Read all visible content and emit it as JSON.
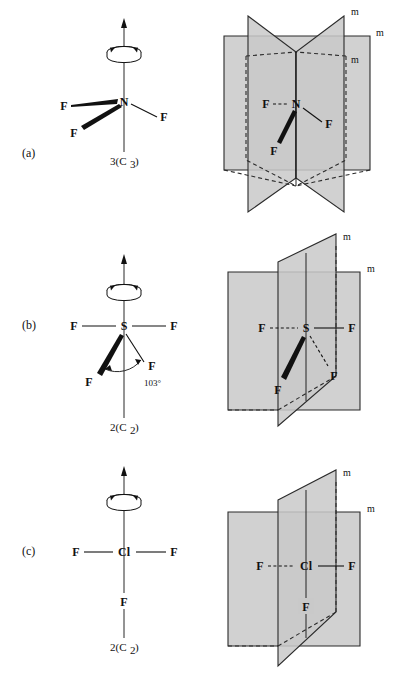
{
  "figure": {
    "title": "",
    "background_color": "#ffffff",
    "plane_fill_color": "#c9c9c9",
    "line_color": "#111111"
  },
  "panels": [
    {
      "id": "a",
      "label": "(a)",
      "molecule": {
        "central_atom": "N",
        "ligands": [
          "F",
          "F",
          "F"
        ],
        "ligand_left_upper": "F",
        "ligand_left_lower": "F",
        "ligand_right": "F"
      },
      "axis_label": "3(C₃)",
      "axis_label_text": "3(C",
      "axis_label_sub": "3",
      "axis_label_close": ")",
      "axis_count": "3",
      "mirror_labels": [
        "m",
        "m",
        "m"
      ],
      "mirror_plane_count": 3,
      "rotation_icon": "rotation-axis-icon"
    },
    {
      "id": "b",
      "label": "(b)",
      "molecule": {
        "central_atom": "S",
        "ligands": [
          "F",
          "F",
          "F",
          "F"
        ],
        "ligand_left": "F",
        "ligand_right": "F",
        "ligand_wedge": "F",
        "ligand_dashed": "F"
      },
      "angle_label": "103°",
      "axis_label": "2(C₂)",
      "axis_label_text": "2(C",
      "axis_label_sub": "2",
      "axis_label_close": ")",
      "axis_count": "2",
      "mirror_labels": [
        "m",
        "m"
      ],
      "mirror_plane_count": 2,
      "rotation_icon": "rotation-axis-icon"
    },
    {
      "id": "c",
      "label": "(c)",
      "molecule": {
        "central_atom": "Cl",
        "ligands": [
          "F",
          "F",
          "F"
        ],
        "ligand_left": "F",
        "ligand_right": "F",
        "ligand_bottom": "F"
      },
      "axis_label": "2(C₂)",
      "axis_label_text": "2(C",
      "axis_label_sub": "2",
      "axis_label_close": ")",
      "axis_count": "2",
      "mirror_labels": [
        "m",
        "m"
      ],
      "mirror_plane_count": 2,
      "rotation_icon": "rotation-axis-icon"
    }
  ]
}
